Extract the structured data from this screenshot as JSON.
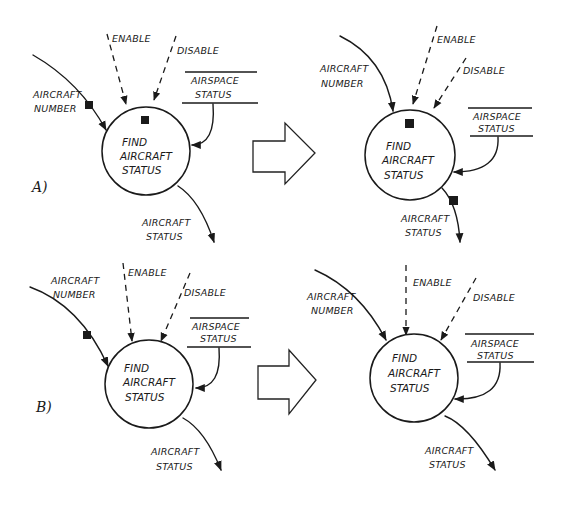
{
  "diagram": {
    "type": "data-flow-diagram-transformation",
    "panels": [
      {
        "id": "A",
        "label": "A)",
        "before": {
          "process": [
            "FIND",
            "AIRCRAFT",
            "STATUS"
          ],
          "inputs": {
            "aircraft_number": [
              "AIRCRAFT",
              "NUMBER"
            ],
            "enable": "ENABLE",
            "disable": "DISABLE",
            "store": [
              "AIRSPACE",
              "STATUS"
            ]
          },
          "output": [
            "AIRCRAFT",
            "STATUS"
          ],
          "markers": [
            "on aircraft number flow",
            "inside process top"
          ]
        },
        "after": {
          "process": [
            "FIND",
            "AIRCRAFT",
            "STATUS"
          ],
          "inputs": {
            "aircraft_number": [
              "AIRCRAFT",
              "NUMBER"
            ],
            "enable": "ENABLE",
            "disable": "DISABLE",
            "store": [
              "AIRSPACE",
              "STATUS"
            ]
          },
          "output": [
            "AIRCRAFT",
            "STATUS"
          ],
          "markers": [
            "inside process top",
            "on aircraft status output flow"
          ]
        }
      },
      {
        "id": "B",
        "label": "B)",
        "before": {
          "process": [
            "FIND",
            "AIRCRAFT",
            "STATUS"
          ],
          "inputs": {
            "aircraft_number": [
              "AIRCRAFT",
              "NUMBER"
            ],
            "enable": "ENABLE",
            "disable": "DISABLE",
            "store": [
              "AIRSPACE",
              "STATUS"
            ]
          },
          "output": [
            "AIRCRAFT",
            "STATUS"
          ],
          "markers": [
            "on aircraft number flow"
          ]
        },
        "after": {
          "process": [
            "FIND",
            "AIRCRAFT",
            "STATUS"
          ],
          "inputs": {
            "aircraft_number": [
              "AIRCRAFT",
              "NUMBER"
            ],
            "enable": "ENABLE",
            "disable": "DISABLE",
            "store": [
              "AIRSPACE",
              "STATUS"
            ]
          },
          "output": [
            "AIRCRAFT",
            "STATUS"
          ],
          "markers": []
        }
      }
    ],
    "transform_arrow": "hollow-right-arrow",
    "colors": {
      "ink": "#1a1a1a",
      "background": "#ffffff"
    }
  }
}
